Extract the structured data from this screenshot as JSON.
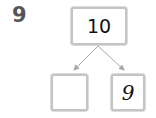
{
  "problem": {
    "number": "9"
  },
  "number_bond": {
    "whole": "10",
    "parts": [
      {
        "value": ""
      },
      {
        "value": "9"
      }
    ]
  },
  "colors": {
    "box_border": "#c4c4c4",
    "line": "#a8a8a8",
    "problem_number": "#555555",
    "text": "#111111"
  }
}
